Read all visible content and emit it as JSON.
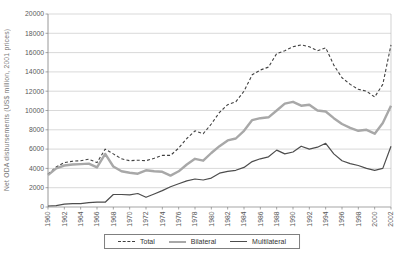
{
  "chart_data": {
    "type": "line",
    "title": "",
    "xlabel": "",
    "ylabel": "Net ODA disbursements (US$ million, 2001 prices)",
    "ylim": [
      0,
      20000
    ],
    "ytick_step": 2000,
    "xtick_step": 2,
    "grid": true,
    "legend_position": "bottom-center",
    "x": [
      1960,
      1961,
      1962,
      1963,
      1964,
      1965,
      1966,
      1967,
      1968,
      1969,
      1970,
      1971,
      1972,
      1973,
      1974,
      1975,
      1976,
      1977,
      1978,
      1979,
      1980,
      1981,
      1982,
      1983,
      1984,
      1985,
      1986,
      1987,
      1988,
      1989,
      1990,
      1991,
      1992,
      1993,
      1994,
      1995,
      1996,
      1997,
      1998,
      1999,
      2000,
      2001,
      2002
    ],
    "series": [
      {
        "name": "Total",
        "style": "dashed",
        "color": "#404040",
        "width": 1.1,
        "values": [
          3400,
          4150,
          4600,
          4750,
          4800,
          4950,
          4600,
          6000,
          5500,
          5000,
          4800,
          4850,
          4800,
          5050,
          5350,
          5350,
          6100,
          7100,
          7900,
          7600,
          8600,
          9800,
          10600,
          10900,
          12000,
          13700,
          14200,
          14500,
          15900,
          16200,
          16600,
          16800,
          16600,
          16200,
          16500,
          14700,
          13400,
          12700,
          12200,
          12000,
          11400,
          12700,
          16800
        ]
      },
      {
        "name": "Bilateral",
        "style": "solid",
        "color": "#a8a8a8",
        "width": 2.4,
        "values": [
          3300,
          4000,
          4300,
          4400,
          4450,
          4500,
          4100,
          5500,
          4200,
          3700,
          3550,
          3450,
          3800,
          3700,
          3650,
          3250,
          3700,
          4400,
          5000,
          4800,
          5600,
          6300,
          6900,
          7100,
          7900,
          9000,
          9200,
          9300,
          10000,
          10700,
          10900,
          10500,
          10600,
          10000,
          9900,
          9200,
          8600,
          8200,
          7900,
          8000,
          7600,
          8700,
          10500
        ]
      },
      {
        "name": "Multilateral",
        "style": "solid",
        "color": "#4d4d4d",
        "width": 1.2,
        "values": [
          100,
          150,
          300,
          350,
          350,
          450,
          500,
          500,
          1300,
          1300,
          1250,
          1400,
          1000,
          1350,
          1700,
          2100,
          2400,
          2700,
          2900,
          2800,
          3000,
          3500,
          3700,
          3800,
          4100,
          4700,
          5000,
          5200,
          5900,
          5500,
          5700,
          6300,
          6000,
          6200,
          6600,
          5500,
          4800,
          4500,
          4300,
          4000,
          3800,
          4000,
          6300
        ]
      }
    ]
  },
  "colors": {
    "gridline": "#c9c9c9",
    "axis": "#7f7f7f",
    "frame": "#bfbfbf",
    "tick_text": "#595959",
    "background": "#ffffff"
  },
  "legend": {
    "items": [
      "Total",
      "Bilateral",
      "Multilateral"
    ]
  }
}
